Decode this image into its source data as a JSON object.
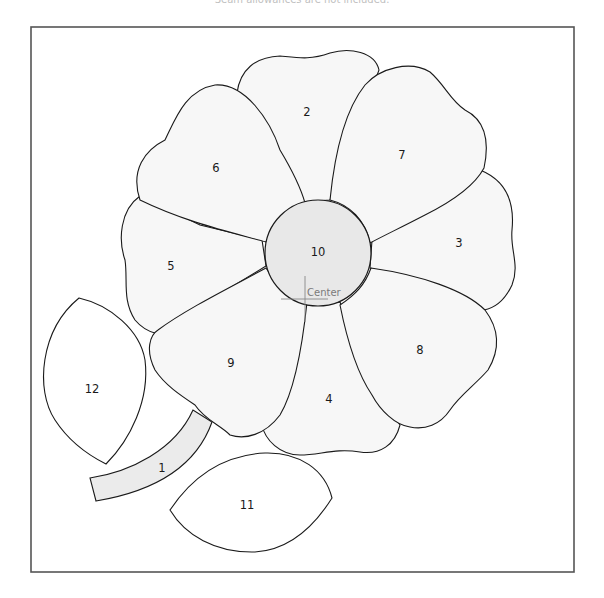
{
  "caption": "Seam allowances are not included.",
  "center_marker_label": "Center",
  "pieces": {
    "p1": "1",
    "p2": "2",
    "p3": "3",
    "p4": "4",
    "p5": "5",
    "p6": "6",
    "p7": "7",
    "p8": "8",
    "p9": "9",
    "p10": "10",
    "p11": "11",
    "p12": "12"
  },
  "colors": {
    "outline": "#1a1a1a",
    "petal_fill": "#f7f7f7",
    "center_fill": "#e8e8e8",
    "stem_fill": "#ebebeb",
    "frame": "#555555"
  }
}
